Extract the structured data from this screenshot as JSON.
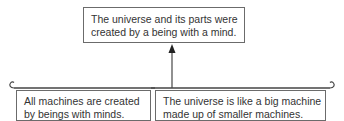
{
  "diagram": {
    "type": "argument-map",
    "conclusion": {
      "lines": [
        "The universe and its parts were",
        "created by a being with a mind."
      ]
    },
    "premises": [
      {
        "lines": [
          "All machines are created",
          "by beings with minds."
        ]
      },
      {
        "lines": [
          "The universe is like a big machine",
          "made up of smaller machines."
        ]
      }
    ],
    "connector": {
      "kind": "bracket-with-arrow",
      "arrow_direction": "up",
      "color": "#555555"
    },
    "colors": {
      "box_border": "#6b6b6b",
      "text": "#333333",
      "background": "#ffffff"
    }
  }
}
